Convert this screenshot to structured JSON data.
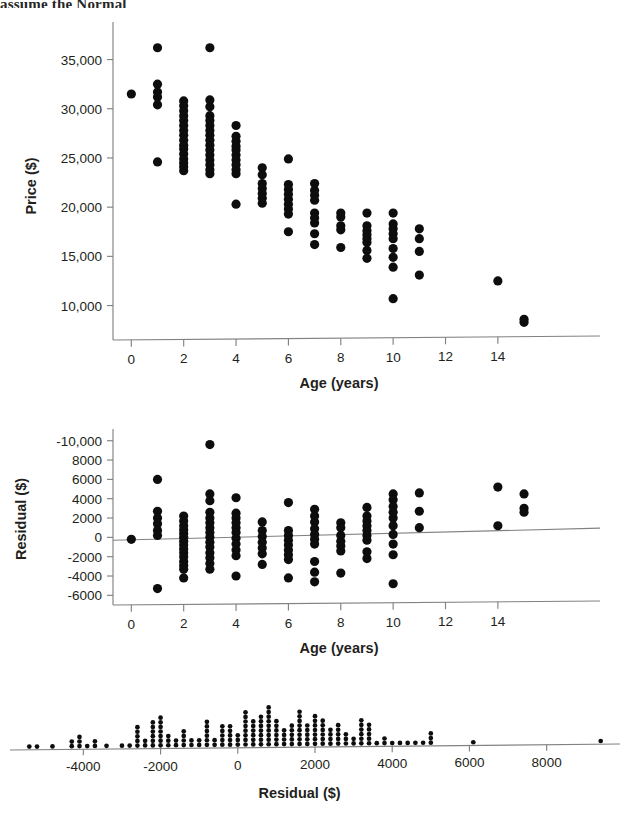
{
  "page": {
    "cut_heading": "assume the Normal",
    "background": "#ffffff",
    "point_color": "#0d0d0d",
    "axis_color": "#808285"
  },
  "chart_data": [
    {
      "id": "price-vs-age-scatter",
      "type": "scatter",
      "title": "",
      "xlabel": "Age (years)",
      "ylabel": "Price ($)",
      "xlim": [
        -0.7,
        15.8
      ],
      "ylim": [
        6500,
        37800
      ],
      "xticks": [
        0,
        2,
        4,
        6,
        8,
        10,
        12,
        14
      ],
      "xticklabels": [
        "0",
        "2",
        "4",
        "6",
        "8",
        "10",
        "12",
        "14"
      ],
      "yticks": [
        10000,
        15000,
        20000,
        25000,
        30000,
        35000
      ],
      "yticklabels": [
        "10,000",
        "15,000",
        "20,000",
        "25,000",
        "30,000",
        "35,000"
      ],
      "grid": false,
      "legend": "none",
      "points": [
        [
          0,
          31500
        ],
        [
          1,
          36200
        ],
        [
          1,
          32500
        ],
        [
          1,
          31700
        ],
        [
          1,
          31200
        ],
        [
          1,
          30400
        ],
        [
          1,
          24600
        ],
        [
          2,
          30800
        ],
        [
          2,
          30300
        ],
        [
          2,
          29800
        ],
        [
          2,
          29300
        ],
        [
          2,
          28800
        ],
        [
          2,
          28300
        ],
        [
          2,
          27800
        ],
        [
          2,
          27300
        ],
        [
          2,
          26800
        ],
        [
          2,
          26300
        ],
        [
          2,
          25900
        ],
        [
          2,
          25400
        ],
        [
          2,
          24900
        ],
        [
          2,
          24500
        ],
        [
          2,
          24100
        ],
        [
          2,
          23700
        ],
        [
          3,
          36200
        ],
        [
          3,
          30900
        ],
        [
          3,
          30200
        ],
        [
          3,
          29300
        ],
        [
          3,
          28800
        ],
        [
          3,
          28300
        ],
        [
          3,
          27800
        ],
        [
          3,
          27300
        ],
        [
          3,
          26800
        ],
        [
          3,
          26300
        ],
        [
          3,
          25800
        ],
        [
          3,
          25300
        ],
        [
          3,
          24800
        ],
        [
          3,
          24300
        ],
        [
          3,
          23800
        ],
        [
          3,
          23400
        ],
        [
          4,
          28300
        ],
        [
          4,
          27200
        ],
        [
          4,
          26700
        ],
        [
          4,
          26200
        ],
        [
          4,
          25800
        ],
        [
          4,
          25300
        ],
        [
          4,
          24800
        ],
        [
          4,
          24300
        ],
        [
          4,
          23800
        ],
        [
          4,
          23400
        ],
        [
          4,
          20300
        ],
        [
          5,
          24000
        ],
        [
          5,
          23300
        ],
        [
          5,
          22400
        ],
        [
          5,
          21900
        ],
        [
          5,
          21400
        ],
        [
          5,
          20900
        ],
        [
          5,
          20400
        ],
        [
          6,
          24900
        ],
        [
          6,
          22300
        ],
        [
          6,
          21800
        ],
        [
          6,
          21300
        ],
        [
          6,
          20800
        ],
        [
          6,
          20300
        ],
        [
          6,
          19800
        ],
        [
          6,
          19300
        ],
        [
          6,
          17500
        ],
        [
          7,
          22400
        ],
        [
          7,
          21700
        ],
        [
          7,
          21200
        ],
        [
          7,
          20700
        ],
        [
          7,
          19400
        ],
        [
          7,
          18900
        ],
        [
          7,
          18400
        ],
        [
          7,
          17300
        ],
        [
          7,
          16200
        ],
        [
          8,
          19400
        ],
        [
          8,
          19000
        ],
        [
          8,
          18100
        ],
        [
          8,
          17700
        ],
        [
          8,
          15900
        ],
        [
          9,
          19400
        ],
        [
          9,
          18100
        ],
        [
          9,
          17600
        ],
        [
          9,
          17200
        ],
        [
          9,
          16800
        ],
        [
          9,
          16400
        ],
        [
          9,
          15600
        ],
        [
          9,
          14800
        ],
        [
          10,
          19400
        ],
        [
          10,
          18300
        ],
        [
          10,
          17800
        ],
        [
          10,
          17300
        ],
        [
          10,
          16800
        ],
        [
          10,
          15800
        ],
        [
          10,
          14900
        ],
        [
          10,
          13900
        ],
        [
          10,
          10700
        ],
        [
          11,
          17800
        ],
        [
          11,
          16800
        ],
        [
          11,
          15500
        ],
        [
          11,
          13100
        ],
        [
          14,
          12500
        ],
        [
          15,
          8600
        ],
        [
          15,
          8300
        ]
      ]
    },
    {
      "id": "residual-vs-age-scatter",
      "type": "scatter",
      "title": "",
      "xlabel": "Age (years)",
      "ylabel": "Residual ($)",
      "xlim": [
        -0.7,
        15.8
      ],
      "ylim": [
        -7000,
        10800
      ],
      "xticks": [
        0,
        2,
        4,
        6,
        8,
        10,
        12,
        14
      ],
      "xticklabels": [
        "0",
        "2",
        "4",
        "6",
        "8",
        "10",
        "12",
        "14"
      ],
      "yticks": [
        -6000,
        -4000,
        -2000,
        0,
        2000,
        4000,
        6000,
        8000,
        10000
      ],
      "yticklabels": [
        "-6000",
        "-4000",
        "-2000",
        "0",
        "2000",
        "4000",
        "6000",
        "8000",
        "-10,000"
      ],
      "grid": false,
      "legend": "none",
      "trendline": {
        "x0": -0.7,
        "y0": -300,
        "x1": 15.8,
        "y1": 950
      },
      "points": [
        [
          0,
          -200
        ],
        [
          1,
          6000
        ],
        [
          1,
          2700
        ],
        [
          1,
          2000
        ],
        [
          1,
          1400
        ],
        [
          1,
          700
        ],
        [
          1,
          200
        ],
        [
          1,
          -5300
        ],
        [
          2,
          2200
        ],
        [
          2,
          1700
        ],
        [
          2,
          1200
        ],
        [
          2,
          800
        ],
        [
          2,
          400
        ],
        [
          2,
          0
        ],
        [
          2,
          -400
        ],
        [
          2,
          -800
        ],
        [
          2,
          -1200
        ],
        [
          2,
          -1600
        ],
        [
          2,
          -2000
        ],
        [
          2,
          -2500
        ],
        [
          2,
          -2900
        ],
        [
          2,
          -3300
        ],
        [
          2,
          -4200
        ],
        [
          3,
          9600
        ],
        [
          3,
          4500
        ],
        [
          3,
          3800
        ],
        [
          3,
          2600
        ],
        [
          3,
          2000
        ],
        [
          3,
          1500
        ],
        [
          3,
          1000
        ],
        [
          3,
          500
        ],
        [
          3,
          0
        ],
        [
          3,
          -500
        ],
        [
          3,
          -1000
        ],
        [
          3,
          -1600
        ],
        [
          3,
          -2100
        ],
        [
          3,
          -2700
        ],
        [
          3,
          -3300
        ],
        [
          4,
          4100
        ],
        [
          4,
          2500
        ],
        [
          4,
          2000
        ],
        [
          4,
          1500
        ],
        [
          4,
          1000
        ],
        [
          4,
          500
        ],
        [
          4,
          -100
        ],
        [
          4,
          -700
        ],
        [
          4,
          -1300
        ],
        [
          4,
          -1900
        ],
        [
          4,
          -4000
        ],
        [
          5,
          1600
        ],
        [
          5,
          700
        ],
        [
          5,
          100
        ],
        [
          5,
          -500
        ],
        [
          5,
          -1100
        ],
        [
          5,
          -1700
        ],
        [
          5,
          -2800
        ],
        [
          6,
          3600
        ],
        [
          6,
          700
        ],
        [
          6,
          200
        ],
        [
          6,
          -300
        ],
        [
          6,
          -800
        ],
        [
          6,
          -1300
        ],
        [
          6,
          -1800
        ],
        [
          6,
          -2300
        ],
        [
          6,
          -4200
        ],
        [
          7,
          2900
        ],
        [
          7,
          2200
        ],
        [
          7,
          1600
        ],
        [
          7,
          900
        ],
        [
          7,
          300
        ],
        [
          7,
          -200
        ],
        [
          7,
          -700
        ],
        [
          7,
          -2500
        ],
        [
          7,
          -3600
        ],
        [
          7,
          -4600
        ],
        [
          8,
          1500
        ],
        [
          8,
          1000
        ],
        [
          8,
          200
        ],
        [
          8,
          -400
        ],
        [
          8,
          -900
        ],
        [
          8,
          -1400
        ],
        [
          8,
          -3700
        ],
        [
          9,
          3100
        ],
        [
          9,
          2200
        ],
        [
          9,
          1700
        ],
        [
          9,
          1200
        ],
        [
          9,
          700
        ],
        [
          9,
          200
        ],
        [
          9,
          -300
        ],
        [
          9,
          -1500
        ],
        [
          9,
          -2200
        ],
        [
          10,
          4500
        ],
        [
          10,
          3900
        ],
        [
          10,
          3200
        ],
        [
          10,
          2600
        ],
        [
          10,
          2000
        ],
        [
          10,
          1200
        ],
        [
          10,
          300
        ],
        [
          10,
          -700
        ],
        [
          10,
          -1800
        ],
        [
          10,
          -4800
        ],
        [
          11,
          4600
        ],
        [
          11,
          2700
        ],
        [
          11,
          1000
        ],
        [
          14,
          5200
        ],
        [
          14,
          1200
        ],
        [
          15,
          4500
        ],
        [
          15,
          3000
        ],
        [
          15,
          2600
        ]
      ]
    },
    {
      "id": "residual-dotplot",
      "type": "scatter",
      "subtype": "dotplot",
      "title": "",
      "xlabel": "Residual ($)",
      "ylabel": "",
      "xlim": [
        -5900,
        9900
      ],
      "ylim": [
        0,
        14
      ],
      "xticks": [
        -4000,
        -2000,
        0,
        2000,
        4000,
        6000,
        8000
      ],
      "xticklabels": [
        "-4000",
        "-2000",
        "0",
        "2000",
        "4000",
        "6000",
        "8000"
      ],
      "grid": false,
      "legend": "none",
      "bin_width": 200,
      "stacks": [
        {
          "x": -5400,
          "count": 1
        },
        {
          "x": -5200,
          "count": 1
        },
        {
          "x": -4800,
          "count": 1
        },
        {
          "x": -4300,
          "count": 2
        },
        {
          "x": -4100,
          "count": 3
        },
        {
          "x": -3900,
          "count": 1
        },
        {
          "x": -3700,
          "count": 2
        },
        {
          "x": -3400,
          "count": 1
        },
        {
          "x": -3000,
          "count": 1
        },
        {
          "x": -2800,
          "count": 1
        },
        {
          "x": -2600,
          "count": 5
        },
        {
          "x": -2400,
          "count": 2
        },
        {
          "x": -2200,
          "count": 6
        },
        {
          "x": -2000,
          "count": 7
        },
        {
          "x": -1800,
          "count": 3
        },
        {
          "x": -1600,
          "count": 2
        },
        {
          "x": -1400,
          "count": 4
        },
        {
          "x": -1200,
          "count": 2
        },
        {
          "x": -1000,
          "count": 2
        },
        {
          "x": -800,
          "count": 6
        },
        {
          "x": -600,
          "count": 2
        },
        {
          "x": -400,
          "count": 5
        },
        {
          "x": -200,
          "count": 5
        },
        {
          "x": 0,
          "count": 3
        },
        {
          "x": 200,
          "count": 8
        },
        {
          "x": 400,
          "count": 6
        },
        {
          "x": 600,
          "count": 7
        },
        {
          "x": 800,
          "count": 9
        },
        {
          "x": 1000,
          "count": 6
        },
        {
          "x": 1200,
          "count": 4
        },
        {
          "x": 1400,
          "count": 5
        },
        {
          "x": 1600,
          "count": 8
        },
        {
          "x": 1800,
          "count": 5
        },
        {
          "x": 2000,
          "count": 7
        },
        {
          "x": 2200,
          "count": 6
        },
        {
          "x": 2400,
          "count": 4
        },
        {
          "x": 2600,
          "count": 5
        },
        {
          "x": 2800,
          "count": 3
        },
        {
          "x": 3000,
          "count": 2
        },
        {
          "x": 3200,
          "count": 6
        },
        {
          "x": 3400,
          "count": 5
        },
        {
          "x": 3600,
          "count": 1
        },
        {
          "x": 3800,
          "count": 2
        },
        {
          "x": 4000,
          "count": 1
        },
        {
          "x": 4200,
          "count": 1
        },
        {
          "x": 4400,
          "count": 1
        },
        {
          "x": 4600,
          "count": 1
        },
        {
          "x": 4800,
          "count": 1
        },
        {
          "x": 5000,
          "count": 3
        },
        {
          "x": 6100,
          "count": 1
        },
        {
          "x": 9400,
          "count": 1
        }
      ]
    }
  ]
}
